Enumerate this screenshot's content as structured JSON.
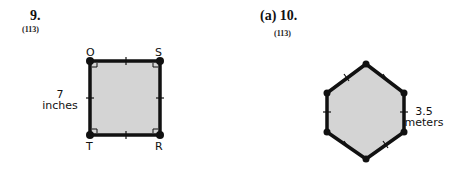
{
  "problems": [
    {
      "number": "9.",
      "reference": "(113)",
      "figure": {
        "shape": "square",
        "vertices": [
          "O",
          "S",
          "R",
          "T"
        ],
        "side_length_value": "7",
        "side_length_unit": "inches",
        "fill_color": "#d4d4d4",
        "stroke_color": "#111111"
      }
    },
    {
      "prefix": "(a)",
      "number": "10.",
      "reference": "(113)",
      "figure": {
        "shape": "regular hexagon",
        "side_length_value": "3.5",
        "side_length_unit": "meters",
        "fill_color": "#d4d4d4",
        "stroke_color": "#111111"
      }
    }
  ]
}
